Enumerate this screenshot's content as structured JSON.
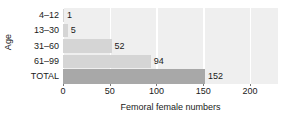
{
  "chart_data": {
    "type": "bar",
    "orientation": "horizontal",
    "title": "",
    "xlabel": "Femoral female numbers",
    "ylabel": "Age",
    "categories": [
      "4–12",
      "13–30",
      "31–60",
      "61–99",
      "TOTAL"
    ],
    "values": [
      1,
      5,
      52,
      94,
      152
    ],
    "value_labels": [
      "1",
      "5",
      "52",
      "94",
      "152"
    ],
    "xlim": [
      0,
      230
    ],
    "ylim": null,
    "xticks": [
      0,
      50,
      100,
      150,
      200
    ],
    "xtick_labels": [
      "0",
      "50",
      "100",
      "150",
      "200"
    ],
    "grid": true,
    "grid_axis": "x",
    "legend": null,
    "bar_colors": [
      "#d5d5d5",
      "#d5d5d5",
      "#d5d5d5",
      "#d5d5d5",
      "#a8a8a8"
    ],
    "plot_background": "#efefef",
    "gridline_color": "#ffffff",
    "figure_background": "#ffffff",
    "text_color": "#1a1a1a"
  }
}
